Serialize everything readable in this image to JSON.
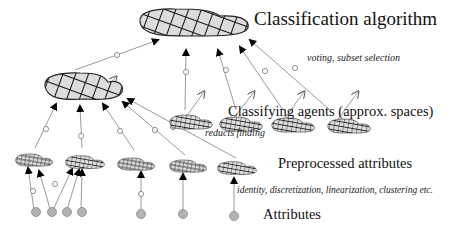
{
  "diagram": {
    "labels": {
      "top": "Classification algorithm",
      "agents": "Classifying agents (approx. spaces)",
      "preprocessed": "Preprocessed attributes",
      "attributes": "Attributes"
    },
    "annotations": {
      "voting": "voting, subset selection",
      "reducts": "reducts finding",
      "preprocessing": "identity, discretization, linearization, clustering etc."
    },
    "levels": [
      {
        "name": "Classification algorithm",
        "nodes": 1
      },
      {
        "name": "Classifying agents",
        "nodes": 5
      },
      {
        "name": "Preprocessed attributes",
        "nodes": 5
      },
      {
        "name": "Attributes",
        "nodes": 7
      }
    ],
    "colors": {
      "node_fill": "#d9d9d9",
      "edge": "#999999",
      "hatch": "#111111",
      "attribute": "#aaaaaa"
    }
  }
}
